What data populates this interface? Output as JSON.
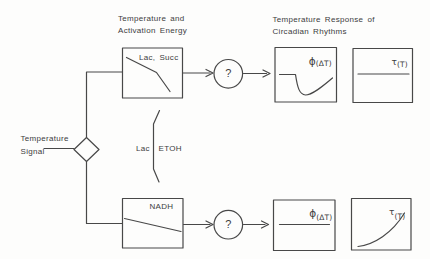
{
  "colors": {
    "stroke": "#484848",
    "text": "#3c3c3c",
    "background": "#fdfdfc"
  },
  "headers": {
    "left_line1": "Temperature and",
    "left_line2": "Activation Energy",
    "right_line1": "Temperature Response of",
    "right_line2": "Circadian Rhythms"
  },
  "input": {
    "line1": "Temperature",
    "line2": "Signal"
  },
  "branch_arrow": {
    "left_label": "Lac",
    "right_label": "ETOH"
  },
  "top_path": {
    "process_label": "Lac, Succ",
    "process_curve": "decreasing line, steepening slope",
    "unknown_label": "?",
    "phase_plot": {
      "sym": "ϕ",
      "arg": "(ΔT)",
      "curve": "flat, sharp transient dip, gradual recovery"
    },
    "period_plot": {
      "sym": "τ",
      "arg": "(T)",
      "curve": "flat horizontal line"
    }
  },
  "bottom_path": {
    "process_label": "NADH",
    "process_curve": "shallow decreasing line",
    "unknown_label": "?",
    "phase_plot": {
      "sym": "ϕ",
      "arg": "(ΔT)",
      "curve": "flat horizontal line"
    },
    "period_plot": {
      "sym": "τ",
      "arg": "(T)",
      "curve": "rising curve, accelerating"
    }
  }
}
